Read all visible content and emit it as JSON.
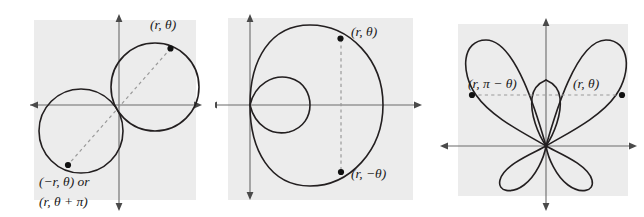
{
  "figure": {
    "background_color": "#ffffff",
    "panel_background_color": "#ececec",
    "curve_color": "#231f20",
    "axis_color": "#6b6b6b",
    "dashed_color": "#9a9a9a",
    "point_color": "#111111",
    "width": 644,
    "height": 217
  },
  "panels": [
    {
      "name": "two-circles-point-symmetry",
      "curve_description": "two tangent circles through the origin",
      "labels": [
        {
          "id": "p1-label-upper",
          "text": "(r, θ)"
        },
        {
          "id": "p1-label-lower-line1",
          "text": "(−r, θ) or"
        },
        {
          "id": "p1-label-lower-line2",
          "text": "(r, θ + π)"
        }
      ],
      "points": [
        {
          "id": "p1-point-upper",
          "label": "(r, θ)"
        },
        {
          "id": "p1-point-lower",
          "label": "(−r, θ)"
        }
      ]
    },
    {
      "name": "limacon-x-axis-symmetry",
      "curve_description": "limacon with inner loop, symmetric about the x-axis",
      "labels": [
        {
          "id": "p2-label-upper",
          "text": "(r, θ)"
        },
        {
          "id": "p2-label-lower",
          "text": "(r, −θ)"
        }
      ],
      "points": [
        {
          "id": "p2-point-upper",
          "label": "(r, θ)"
        },
        {
          "id": "p2-point-lower",
          "label": "(r, −θ)"
        }
      ]
    },
    {
      "name": "rose-y-axis-symmetry",
      "curve_description": "four-petal rose, symmetric about the y-axis",
      "labels": [
        {
          "id": "p3-label-left",
          "text": "(r, π − θ)"
        },
        {
          "id": "p3-label-right",
          "text": "(r, θ)"
        }
      ],
      "points": [
        {
          "id": "p3-point-left",
          "label": "(r, π − θ)"
        },
        {
          "id": "p3-point-right",
          "label": "(r, θ)"
        }
      ]
    }
  ]
}
